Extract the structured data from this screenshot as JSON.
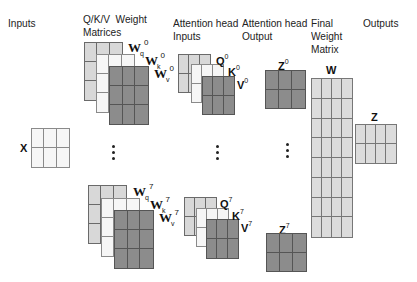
{
  "headers": {
    "inputs": "Inputs",
    "qkv_weights": "Q/K/V  Weight\nMatrices",
    "attn_inputs": "Attention head\nInputs",
    "attn_output": "Attention head\nOutput",
    "final_weight": "Final\nWeight\nMatrix",
    "outputs": "Outputs"
  },
  "labels": {
    "x": "X",
    "wq0": {
      "base": "W",
      "sub": "q",
      "sup": "0"
    },
    "wk0": {
      "base": "W",
      "sub": "k",
      "sup": "0"
    },
    "wv0": {
      "base": "W",
      "sub": "v",
      "sup": "0"
    },
    "wq7": {
      "base": "W",
      "sub": "q",
      "sup": "7"
    },
    "wk7": {
      "base": "W",
      "sub": "k",
      "sup": "7"
    },
    "wv7": {
      "base": "W",
      "sub": "v",
      "sup": "7"
    },
    "q0": {
      "base": "Q",
      "sup": "0"
    },
    "k0": {
      "base": "K",
      "sup": "0"
    },
    "v0": {
      "base": "V",
      "sup": "0"
    },
    "q7": {
      "base": "Q",
      "sup": "7"
    },
    "k7": {
      "base": "K",
      "sup": "7"
    },
    "v7": {
      "base": "V",
      "sup": "7"
    },
    "z0": {
      "base": "Z",
      "sup": "0"
    },
    "z7": {
      "base": "Z",
      "sup": "7"
    },
    "w": "W",
    "z": "Z"
  },
  "matrices": {
    "x": {
      "cols": 3,
      "rows": 2
    },
    "wq": {
      "cols": 3,
      "rows": 3
    },
    "wk": {
      "cols": 3,
      "rows": 3
    },
    "wv": {
      "cols": 3,
      "rows": 3
    },
    "q": {
      "cols": 3,
      "rows": 2
    },
    "k": {
      "cols": 3,
      "rows": 2
    },
    "v": {
      "cols": 3,
      "rows": 2
    },
    "z_head": {
      "cols": 3,
      "rows": 2
    },
    "w": {
      "cols": 4,
      "rows": 8
    },
    "z_out": {
      "cols": 4,
      "rows": 2
    }
  },
  "colors": {
    "light": "#d8d8d8",
    "white": "#f6f6f6",
    "dark": "#8c8c8c",
    "final": "#dcdcdc"
  },
  "ellipsis": "⋮"
}
